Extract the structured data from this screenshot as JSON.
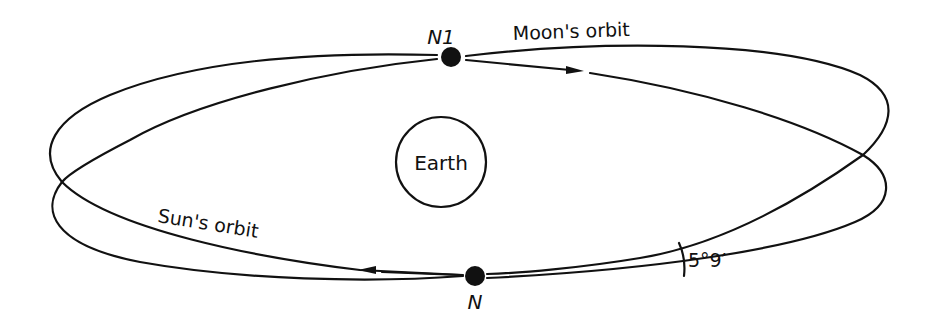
{
  "diagram": {
    "type": "orbital-planes",
    "colors": {
      "line": "#111111",
      "background": "#ffffff"
    },
    "labels": {
      "node_upper": "N1",
      "node_lower": "N",
      "moon_orbit": "Moon's orbit",
      "sun_orbit": "Sun's orbit",
      "earth": "Earth",
      "inclination": "5°9′"
    },
    "elements": [
      {
        "id": "earth",
        "shape": "circle",
        "label": "Earth"
      },
      {
        "id": "moon-orbit",
        "shape": "ellipse",
        "label": "Moon's orbit",
        "direction": "arrow pointing right near top"
      },
      {
        "id": "sun-orbit",
        "shape": "ellipse",
        "label": "Sun's orbit",
        "direction": "arrow pointing left near bottom"
      },
      {
        "id": "node-n1",
        "shape": "dot",
        "label": "N1"
      },
      {
        "id": "node-n",
        "shape": "dot",
        "label": "N"
      },
      {
        "id": "angle-arc",
        "shape": "arc",
        "label": "5°9′"
      }
    ]
  }
}
